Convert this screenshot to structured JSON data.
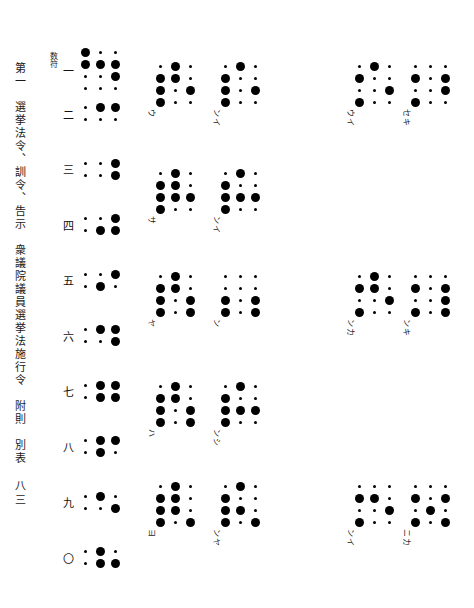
{
  "document": {
    "heading": "第一　選挙法令、訓令、告示　衆議院議員選挙法施行令　附則　別表",
    "folio": "八三",
    "number_sign_tag": "数符"
  },
  "legend": {
    "dot_on": "raised-dot",
    "dot_off": "flat-dot",
    "dot_ring": "open-dot"
  },
  "numerals": [
    {
      "label": "一",
      "cells": [
        [
          1,
          0,
          0
        ],
        [
          1,
          1,
          1
        ],
        [
          0,
          0,
          1
        ],
        [
          0,
          0,
          0
        ]
      ],
      "tagged": true
    },
    {
      "label": "二",
      "cells": [
        [
          0,
          1,
          1
        ],
        [
          0,
          0,
          0
        ]
      ]
    },
    {
      "label": "三",
      "cells": [
        [
          0,
          0,
          1
        ],
        [
          0,
          0,
          1
        ]
      ]
    },
    {
      "label": "四",
      "cells": [
        [
          0,
          0,
          1
        ],
        [
          0,
          1,
          1
        ]
      ]
    },
    {
      "label": "五",
      "cells": [
        [
          0,
          0,
          1
        ],
        [
          0,
          1,
          0
        ]
      ]
    },
    {
      "label": "六",
      "cells": [
        [
          0,
          1,
          1
        ],
        [
          0,
          0,
          1
        ]
      ]
    },
    {
      "label": "七",
      "cells": [
        [
          0,
          1,
          1
        ],
        [
          0,
          1,
          1
        ]
      ]
    },
    {
      "label": "八",
      "cells": [
        [
          0,
          1,
          1
        ],
        [
          0,
          1,
          0
        ]
      ]
    },
    {
      "label": "九",
      "cells": [
        [
          0,
          1,
          0
        ],
        [
          0,
          0,
          1
        ]
      ]
    },
    {
      "label": "〇",
      "cells": [
        [
          0,
          1,
          0
        ],
        [
          0,
          1,
          1
        ]
      ]
    }
  ],
  "groups": [
    {
      "id": "g-c2-r1",
      "col": 2,
      "row": 1,
      "kana": "ウ",
      "cells": [
        [
          0,
          1,
          0
        ],
        [
          1,
          1,
          0
        ],
        [
          1,
          0,
          1
        ],
        [
          1,
          0,
          0
        ]
      ]
    },
    {
      "id": "g-c3-r1",
      "col": 3,
      "row": 1,
      "kana": "ンイ",
      "cells": [
        [
          0,
          1,
          0
        ],
        [
          1,
          0,
          0
        ],
        [
          1,
          0,
          1
        ],
        [
          1,
          0,
          0
        ]
      ]
    },
    {
      "id": "g-c5-r1",
      "col": 5,
      "row": 1,
      "kana": "ウイ",
      "cells": [
        [
          0,
          1,
          0
        ],
        [
          1,
          0,
          0
        ],
        [
          0,
          0,
          1
        ],
        [
          1,
          0,
          0
        ]
      ]
    },
    {
      "id": "g-c6-r1",
      "col": 6,
      "row": 1,
      "kana": "セキ",
      "cells": [
        [
          0,
          0,
          0
        ],
        [
          1,
          0,
          1
        ],
        [
          0,
          0,
          1
        ],
        [
          1,
          0,
          0
        ]
      ]
    },
    {
      "id": "g-c2-r2",
      "col": 2,
      "row": 2,
      "kana": "サ",
      "cells": [
        [
          0,
          1,
          0
        ],
        [
          1,
          1,
          0
        ],
        [
          1,
          1,
          1
        ],
        [
          1,
          0,
          0
        ]
      ]
    },
    {
      "id": "g-c3-r2",
      "col": 3,
      "row": 2,
      "kana": "ンイ",
      "cells": [
        [
          0,
          1,
          0
        ],
        [
          1,
          0,
          0
        ],
        [
          1,
          1,
          1
        ],
        [
          1,
          0,
          0
        ]
      ]
    },
    {
      "id": "g-c2-r3",
      "col": 2,
      "row": 3,
      "kana": "ヤ",
      "cells": [
        [
          0,
          1,
          0
        ],
        [
          1,
          1,
          0
        ],
        [
          1,
          0,
          1
        ],
        [
          1,
          0,
          1
        ]
      ]
    },
    {
      "id": "g-c3-r3",
      "col": 3,
      "row": 3,
      "kana": "ン",
      "cells": [
        [
          0,
          0,
          0
        ],
        [
          0,
          0,
          0
        ],
        [
          1,
          0,
          1
        ],
        [
          1,
          0,
          1
        ]
      ]
    },
    {
      "id": "g-c5-r3",
      "col": 5,
      "row": 3,
      "kana": "ンカ",
      "cells": [
        [
          0,
          1,
          0
        ],
        [
          1,
          1,
          0
        ],
        [
          0,
          0,
          1
        ],
        [
          1,
          0,
          0
        ]
      ]
    },
    {
      "id": "g-c6-r3",
      "col": 6,
      "row": 3,
      "kana": "ンキ",
      "cells": [
        [
          0,
          0,
          0
        ],
        [
          1,
          0,
          1
        ],
        [
          0,
          0,
          1
        ],
        [
          1,
          0,
          1
        ]
      ]
    },
    {
      "id": "g-c2-r4",
      "col": 2,
      "row": 4,
      "kana": "ハ",
      "cells": [
        [
          0,
          1,
          0
        ],
        [
          1,
          1,
          0
        ],
        [
          1,
          0,
          1
        ],
        [
          1,
          0,
          1
        ]
      ]
    },
    {
      "id": "g-c3-r4",
      "col": 3,
      "row": 4,
      "kana": "ンシ",
      "cells": [
        [
          0,
          1,
          0
        ],
        [
          1,
          0,
          0
        ],
        [
          1,
          1,
          1
        ],
        [
          1,
          0,
          0
        ]
      ]
    },
    {
      "id": "g-c2-r5",
      "col": 2,
      "row": 5,
      "kana": "ヨ",
      "cells": [
        [
          0,
          1,
          0
        ],
        [
          1,
          1,
          0
        ],
        [
          1,
          1,
          0
        ],
        [
          1,
          0,
          1
        ]
      ]
    },
    {
      "id": "g-c3-r5",
      "col": 3,
      "row": 5,
      "kana": "ンヤ",
      "cells": [
        [
          0,
          1,
          0
        ],
        [
          1,
          0,
          0
        ],
        [
          1,
          1,
          0
        ],
        [
          1,
          0,
          1
        ]
      ]
    },
    {
      "id": "g-c5-r5",
      "col": 5,
      "row": 5,
      "kana": "ンイ",
      "cells": [
        [
          0,
          0,
          0
        ],
        [
          1,
          1,
          0
        ],
        [
          0,
          0,
          1
        ],
        [
          1,
          0,
          0
        ]
      ]
    },
    {
      "id": "g-c6-r5",
      "col": 6,
      "row": 5,
      "kana": "ニカ",
      "cells": [
        [
          0,
          0,
          0
        ],
        [
          1,
          0,
          1
        ],
        [
          0,
          1,
          0
        ],
        [
          1,
          0,
          1
        ]
      ]
    }
  ]
}
